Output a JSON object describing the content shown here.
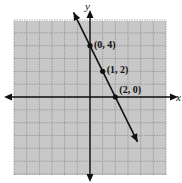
{
  "chart_data": {
    "type": "line",
    "title": "",
    "xlabel": "x",
    "ylabel": "y",
    "xlim": [
      -6,
      6
    ],
    "ylim": [
      -6,
      6
    ],
    "grid": true,
    "series": [
      {
        "name": "line",
        "equation": "y = -2x + 4",
        "x": [
          0,
          1,
          2
        ],
        "y": [
          4,
          2,
          0
        ],
        "arrows": "both"
      }
    ],
    "points": [
      {
        "label": "(0, 4)",
        "x": 0,
        "y": 4
      },
      {
        "label": "(1, 2)",
        "x": 1,
        "y": 2
      },
      {
        "label": "(2, 0)",
        "x": 2,
        "y": 0
      }
    ],
    "colors": {
      "grid_bg": "#c8c8c8",
      "grid_line": "#8a8a8a",
      "ink": "#111111"
    }
  }
}
